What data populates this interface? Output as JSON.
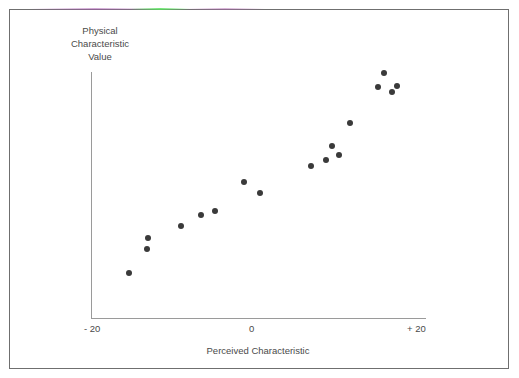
{
  "figure": {
    "background_color": "#ffffff",
    "frame_color": "#6f6f6f",
    "axis_color": "#9a9a9a",
    "point_color": "#3a3a3a"
  },
  "chart_data": {
    "type": "scatter",
    "title": "",
    "xlabel": "Perceived Characteristic",
    "ylabel": "Physical\nCharacteristic\nValue",
    "ylabel_lines": [
      "Physical",
      "Characteristic",
      "Value"
    ],
    "xlim": [
      -20,
      20
    ],
    "ylim": [
      0,
      100
    ],
    "xticks": [
      -20,
      0,
      20
    ],
    "xticklabels": [
      "- 20",
      "0",
      "+ 20"
    ],
    "yticks": [],
    "yticklabels": [],
    "grid": false,
    "legend": null,
    "annotations": [],
    "series": [
      {
        "name": "observations",
        "marker": "circle",
        "color": "#3a3a3a",
        "points": [
          {
            "x": -15.4,
            "y": 18.3
          },
          {
            "x": -13.3,
            "y": 28.0
          },
          {
            "x": -13.2,
            "y": 32.5
          },
          {
            "x": -9.2,
            "y": 37.4
          },
          {
            "x": -6.8,
            "y": 41.9
          },
          {
            "x": -5.2,
            "y": 43.5
          },
          {
            "x": -1.7,
            "y": 55.3
          },
          {
            "x": 0.2,
            "y": 50.8
          },
          {
            "x": 6.4,
            "y": 61.8
          },
          {
            "x": 8.2,
            "y": 64.2
          },
          {
            "x": 8.9,
            "y": 69.9
          },
          {
            "x": 9.7,
            "y": 66.3
          },
          {
            "x": 11.0,
            "y": 79.3
          },
          {
            "x": 14.4,
            "y": 93.9
          },
          {
            "x": 15.1,
            "y": 99.6
          },
          {
            "x": 16.0,
            "y": 91.9
          },
          {
            "x": 16.7,
            "y": 94.3
          }
        ]
      }
    ]
  }
}
